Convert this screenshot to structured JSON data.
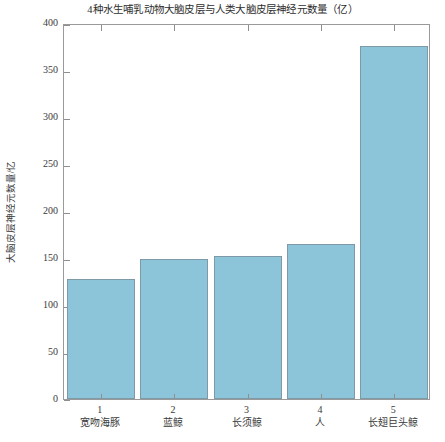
{
  "chart_data": {
    "type": "bar",
    "title": "4种水生哺乳动物大脑皮层与人类大脑皮层神经元数量（亿）",
    "xlabel": "",
    "ylabel": "大脑皮层神经元数量/亿",
    "ylim": [
      0,
      400
    ],
    "yticks": [
      0,
      50,
      100,
      150,
      200,
      250,
      300,
      350,
      400
    ],
    "grid": false,
    "legend": null,
    "categories": [
      "宽吻海豚",
      "蓝鲸",
      "长须鲸",
      "人",
      "长翅巨头鲸"
    ],
    "category_numbers": [
      "1",
      "2",
      "3",
      "4",
      "5"
    ],
    "values": [
      128,
      149,
      152,
      165,
      376
    ],
    "bar_color": "#8cc5da",
    "bar_border_color": "#7d9aa6",
    "axis_color": "#9a9a9a"
  }
}
